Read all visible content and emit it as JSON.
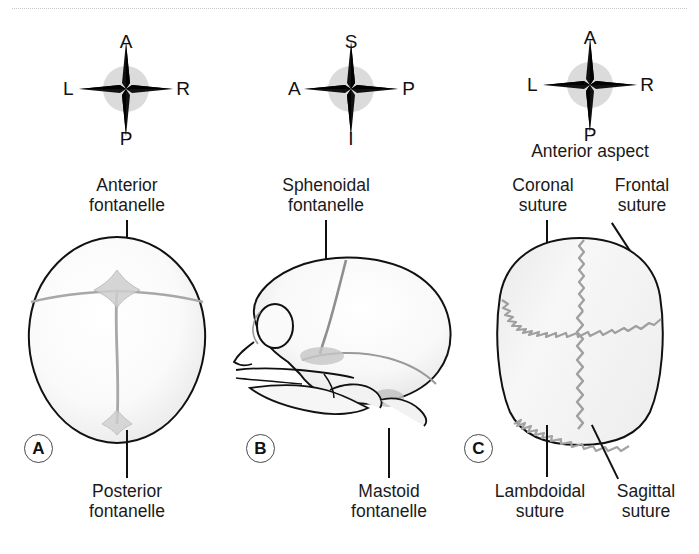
{
  "figure": {
    "divider": "dotted-rule"
  },
  "colors": {
    "ink": "#1a1a1a",
    "outline": "#111111",
    "bone_fill": "#f4f4f4",
    "suture": "#9a9a9a",
    "compass_halo": "#cfcfcf",
    "badge_border": "#4a4a4a"
  },
  "panels": [
    {
      "id": "A",
      "badge": "A",
      "view": "superior-view-infant-skull",
      "compass": {
        "name": "compass-rose-a",
        "north": "A",
        "south": "P",
        "west": "L",
        "east": "R"
      },
      "labels": [
        {
          "name": "anterior-fontanelle-label",
          "line1": "Anterior",
          "line2": "fontanelle",
          "position": "top"
        },
        {
          "name": "posterior-fontanelle-label",
          "line1": "Posterior",
          "line2": "fontanelle",
          "position": "bottom"
        }
      ]
    },
    {
      "id": "B",
      "badge": "B",
      "view": "lateral-view-infant-skull",
      "compass": {
        "name": "compass-rose-b",
        "north": "S",
        "south": "I",
        "west": "A",
        "east": "P"
      },
      "labels": [
        {
          "name": "sphenoidal-fontanelle-label",
          "line1": "Sphenoidal",
          "line2": "fontanelle",
          "position": "top"
        },
        {
          "name": "mastoid-fontanelle-label",
          "line1": "Mastoid",
          "line2": "fontanelle",
          "position": "bottom"
        }
      ]
    },
    {
      "id": "C",
      "badge": "C",
      "view": "anterior-aspect-adult-skull",
      "caption": "Anterior aspect",
      "compass": {
        "name": "compass-rose-c",
        "north": "A",
        "south": "P",
        "west": "L",
        "east": "R"
      },
      "labels": [
        {
          "name": "coronal-suture-label",
          "line1": "Coronal",
          "line2": "suture",
          "position": "top-left"
        },
        {
          "name": "frontal-suture-label",
          "line1": "Frontal",
          "line2": "suture",
          "position": "top-right"
        },
        {
          "name": "lambdoidal-suture-label",
          "line1": "Lambdoidal",
          "line2": "suture",
          "position": "bottom-left"
        },
        {
          "name": "sagittal-suture-label",
          "line1": "Sagittal",
          "line2": "suture",
          "position": "bottom-right"
        }
      ]
    }
  ]
}
